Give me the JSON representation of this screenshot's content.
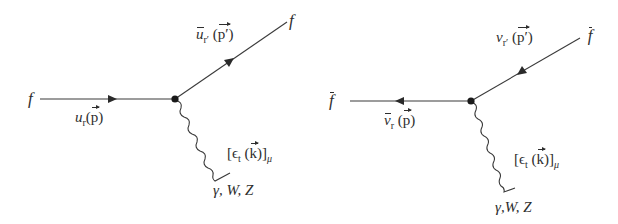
{
  "diagrams": [
    {
      "id": "fermion",
      "incoming": {
        "particle": "f",
        "spinor": "u",
        "index": "r",
        "momentum": "p"
      },
      "outgoing": {
        "particle": "f",
        "spinor": "ū",
        "index": "r′",
        "momentum": "p′"
      },
      "boson": {
        "polarization": "ϵ",
        "index": "t",
        "momentum": "k",
        "lorentz_index": "μ",
        "name": "γ, W, Z"
      }
    },
    {
      "id": "antifermion",
      "incoming": {
        "particle": "f̄",
        "spinor": "v",
        "index": "r′",
        "momentum": "p′"
      },
      "outgoing": {
        "particle": "f̄",
        "spinor": "v̄",
        "index": "r",
        "momentum": "p"
      },
      "boson": {
        "polarization": "ϵ",
        "index": "t",
        "momentum": "k",
        "lorentz_index": "μ",
        "name": "γ,W, Z"
      }
    }
  ],
  "labels": {
    "left_f_in": "f",
    "left_f_out": "f",
    "left_u": "u",
    "left_u_sub": "r",
    "left_p": "p",
    "left_ubar": "u",
    "left_ubar_sub": "r′",
    "left_pprime": "p′",
    "left_eps_open": "[",
    "left_eps": "ϵ",
    "left_eps_sub": "t",
    "left_k": "k",
    "left_eps_close": ")]",
    "left_mu": "μ",
    "left_boson": "γ, W, Z",
    "right_fbar_out": "f",
    "right_fbar_in": "f",
    "right_vbar": "v",
    "right_vbar_sub": "r",
    "right_p": "p",
    "right_v": "v",
    "right_v_sub": "r′",
    "right_pprime": "p′",
    "right_eps_open": "[",
    "right_eps": "ϵ",
    "right_eps_sub": "t",
    "right_k": "k",
    "right_eps_close": ")]",
    "right_mu": "μ",
    "right_boson": "γ,W, Z"
  },
  "colors": {
    "line": "#3a3a3a",
    "vertex": "#1a1a1a",
    "text": "#2e2e2e"
  }
}
